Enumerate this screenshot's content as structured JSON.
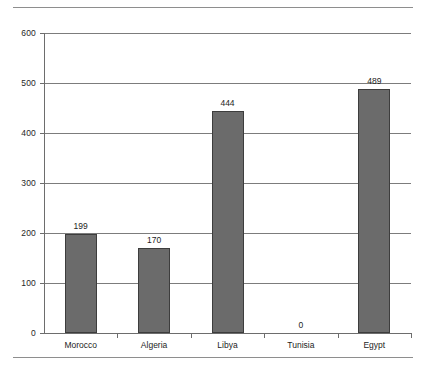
{
  "chart_data": {
    "type": "bar",
    "title": "",
    "subtitle": "",
    "xlabel": "",
    "ylabel": "",
    "categories": [
      "Morocco",
      "Algeria",
      "Libya",
      "Tunisia",
      "Egypt"
    ],
    "values": [
      199,
      170,
      444,
      0,
      489
    ],
    "value_labels": [
      "199",
      "170",
      "444",
      "0",
      "489"
    ],
    "ylim": [
      0,
      600
    ],
    "ytick_labels": [
      "0",
      "100",
      "200",
      "300",
      "400",
      "500",
      "600"
    ],
    "ytick_values": [
      0,
      100,
      200,
      300,
      400,
      500,
      600
    ],
    "grid": "horizontal",
    "legend": "none",
    "bar_color": "#6b6b6b",
    "bar_border_color": "#3d3d3d",
    "gridline_color": "#7c7c7c",
    "axis_color": "#6d6d6d",
    "background_color": "#ffffff"
  },
  "decor": {
    "rule_color": "#8e8e8e"
  }
}
